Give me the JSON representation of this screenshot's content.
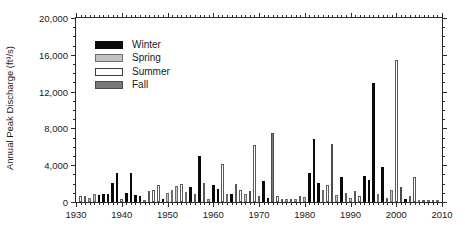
{
  "chart_data": {
    "type": "bar",
    "title": "",
    "xlabel": "",
    "ylabel": "Annual Peak Discharge (ft³/s)",
    "xlim": [
      1930,
      2010
    ],
    "ylim": [
      0,
      20000
    ],
    "grid": false,
    "legend_position": "upper-left-inside",
    "y_ticks": [
      0,
      4000,
      8000,
      12000,
      16000,
      20000
    ],
    "y_tick_labels": [
      "0",
      "4,000",
      "8,000",
      "12,000",
      "16,000",
      "20,000"
    ],
    "y_minor_tick_interval": 1000,
    "x_ticks": [
      1930,
      1940,
      1950,
      1960,
      1970,
      1980,
      1990,
      2000,
      2010
    ],
    "x_tick_labels": [
      "1930",
      "1940",
      "1950",
      "1960",
      "1970",
      "1980",
      "1990",
      "2000",
      "2010"
    ],
    "x_minor_tick_interval": 1,
    "series": [
      {
        "name": "Winter",
        "color": "#0a0a0a",
        "key": "winter"
      },
      {
        "name": "Spring",
        "color": "#c2c2c2",
        "key": "spring"
      },
      {
        "name": "Summer",
        "color": "#ffffff",
        "key": "summer"
      },
      {
        "name": "Fall",
        "color": "#787878",
        "key": "fall"
      }
    ],
    "bars": [
      {
        "year": 1931,
        "value": 620,
        "season": "summer"
      },
      {
        "year": 1932,
        "value": 700,
        "season": "summer"
      },
      {
        "year": 1933,
        "value": 450,
        "season": "spring"
      },
      {
        "year": 1934,
        "value": 820,
        "season": "spring"
      },
      {
        "year": 1935,
        "value": 800,
        "season": "winter"
      },
      {
        "year": 1936,
        "value": 860,
        "season": "winter"
      },
      {
        "year": 1937,
        "value": 900,
        "season": "winter"
      },
      {
        "year": 1938,
        "value": 2050,
        "season": "winter"
      },
      {
        "year": 1939,
        "value": 3200,
        "season": "winter"
      },
      {
        "year": 1940,
        "value": 330,
        "season": "summer"
      },
      {
        "year": 1941,
        "value": 950,
        "season": "winter"
      },
      {
        "year": 1942,
        "value": 3180,
        "season": "winter"
      },
      {
        "year": 1943,
        "value": 800,
        "season": "winter"
      },
      {
        "year": 1944,
        "value": 620,
        "season": "winter"
      },
      {
        "year": 1945,
        "value": 250,
        "season": "spring"
      },
      {
        "year": 1946,
        "value": 1150,
        "season": "summer"
      },
      {
        "year": 1947,
        "value": 1320,
        "season": "summer"
      },
      {
        "year": 1948,
        "value": 1800,
        "season": "summer"
      },
      {
        "year": 1949,
        "value": 300,
        "season": "winter"
      },
      {
        "year": 1950,
        "value": 1000,
        "season": "spring"
      },
      {
        "year": 1951,
        "value": 1350,
        "season": "spring"
      },
      {
        "year": 1952,
        "value": 1700,
        "season": "spring"
      },
      {
        "year": 1953,
        "value": 2000,
        "season": "summer"
      },
      {
        "year": 1954,
        "value": 1050,
        "season": "spring"
      },
      {
        "year": 1955,
        "value": 1600,
        "season": "winter"
      },
      {
        "year": 1956,
        "value": 900,
        "season": "summer"
      },
      {
        "year": 1957,
        "value": 5050,
        "season": "winter"
      },
      {
        "year": 1958,
        "value": 2050,
        "season": "summer"
      },
      {
        "year": 1959,
        "value": 350,
        "season": "spring"
      },
      {
        "year": 1960,
        "value": 1800,
        "season": "winter"
      },
      {
        "year": 1961,
        "value": 1400,
        "season": "winter"
      },
      {
        "year": 1962,
        "value": 4150,
        "season": "summer"
      },
      {
        "year": 1963,
        "value": 900,
        "season": "spring"
      },
      {
        "year": 1964,
        "value": 880,
        "season": "winter"
      },
      {
        "year": 1965,
        "value": 2000,
        "season": "summer"
      },
      {
        "year": 1966,
        "value": 1350,
        "season": "summer"
      },
      {
        "year": 1967,
        "value": 900,
        "season": "spring"
      },
      {
        "year": 1968,
        "value": 1250,
        "season": "fall"
      },
      {
        "year": 1969,
        "value": 6250,
        "season": "summer"
      },
      {
        "year": 1970,
        "value": 600,
        "season": "summer"
      },
      {
        "year": 1971,
        "value": 2300,
        "season": "winter"
      },
      {
        "year": 1972,
        "value": 400,
        "season": "winter"
      },
      {
        "year": 1973,
        "value": 7550,
        "season": "fall"
      },
      {
        "year": 1974,
        "value": 700,
        "season": "summer"
      },
      {
        "year": 1975,
        "value": 330,
        "season": "summer"
      },
      {
        "year": 1976,
        "value": 300,
        "season": "spring"
      },
      {
        "year": 1977,
        "value": 280,
        "season": "summer"
      },
      {
        "year": 1978,
        "value": 300,
        "season": "spring"
      },
      {
        "year": 1979,
        "value": 600,
        "season": "summer"
      },
      {
        "year": 1980,
        "value": 500,
        "season": "spring"
      },
      {
        "year": 1981,
        "value": 3100,
        "season": "winter"
      },
      {
        "year": 1982,
        "value": 6850,
        "season": "winter"
      },
      {
        "year": 1983,
        "value": 2100,
        "season": "winter"
      },
      {
        "year": 1984,
        "value": 1350,
        "season": "spring"
      },
      {
        "year": 1985,
        "value": 1900,
        "season": "summer"
      },
      {
        "year": 1986,
        "value": 6300,
        "season": "fall"
      },
      {
        "year": 1987,
        "value": 750,
        "season": "spring"
      },
      {
        "year": 1988,
        "value": 2700,
        "season": "winter"
      },
      {
        "year": 1989,
        "value": 1000,
        "season": "summer"
      },
      {
        "year": 1990,
        "value": 450,
        "season": "spring"
      },
      {
        "year": 1991,
        "value": 1250,
        "season": "summer"
      },
      {
        "year": 1992,
        "value": 700,
        "season": "summer"
      },
      {
        "year": 1993,
        "value": 2800,
        "season": "winter"
      },
      {
        "year": 1994,
        "value": 2350,
        "season": "winter"
      },
      {
        "year": 1995,
        "value": 12950,
        "season": "winter"
      },
      {
        "year": 1996,
        "value": 850,
        "season": "spring"
      },
      {
        "year": 1997,
        "value": 3850,
        "season": "winter"
      },
      {
        "year": 1998,
        "value": 420,
        "season": "summer"
      },
      {
        "year": 1999,
        "value": 1300,
        "season": "spring"
      },
      {
        "year": 2000,
        "value": 15450,
        "season": "summer"
      },
      {
        "year": 2001,
        "value": 1650,
        "season": "fall"
      },
      {
        "year": 2002,
        "value": 280,
        "season": "winter"
      },
      {
        "year": 2003,
        "value": 600,
        "season": "summer"
      },
      {
        "year": 2004,
        "value": 2700,
        "season": "summer"
      },
      {
        "year": 2005,
        "value": 260,
        "season": "spring"
      },
      {
        "year": 2006,
        "value": 250,
        "season": "summer"
      },
      {
        "year": 2007,
        "value": 230,
        "season": "spring"
      },
      {
        "year": 2008,
        "value": 220,
        "season": "summer"
      },
      {
        "year": 2009,
        "value": 240,
        "season": "spring"
      }
    ]
  },
  "legend": {
    "items": [
      {
        "label": "Winter",
        "key": "winter"
      },
      {
        "label": "Spring",
        "key": "spring"
      },
      {
        "label": "Summer",
        "key": "summer"
      },
      {
        "label": "Fall",
        "key": "fall"
      }
    ]
  }
}
